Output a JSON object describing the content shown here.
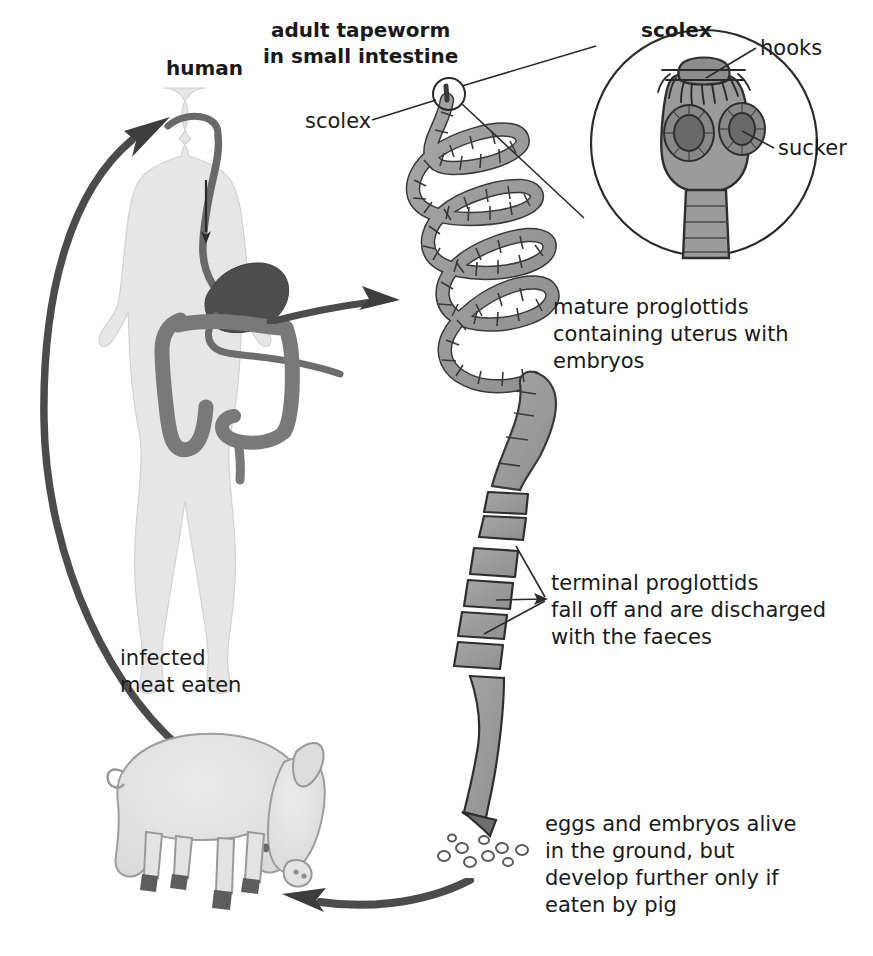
{
  "diagram": {
    "type": "biological-life-cycle-diagram",
    "palette": {
      "background": "#ffffff",
      "body_silhouette": "#e9e9e9",
      "body_outline": "#cfcfcf",
      "organ_dark": "#5a5a5a",
      "organ_mid": "#7b7b7b",
      "worm_fill": "#9d9d9d",
      "worm_outline": "#3a3a3a",
      "arrow_dark": "#4a4a4a",
      "pig_fill": "#e6e6e6",
      "pig_outline": "#9b9b9b",
      "hoof_dark": "#5e5e5e",
      "leader_line": "#3a3a3a",
      "text": "#1a1a1a"
    },
    "labels": {
      "human": "human",
      "adult_tapeworm": "adult tapeworm\nin small intestine",
      "scolex_small": "scolex",
      "scolex_magnified": "scolex",
      "hooks": "hooks",
      "sucker": "sucker",
      "mature_proglottids": "mature proglottids\ncontaining uterus with\nembryos",
      "terminal_proglottids": "terminal proglottids\nfall off and are discharged\nwith the faeces",
      "eggs": "eggs and embryos alive\nin the ground, but\ndevelop further only if\neaten by pig",
      "infected_meat": "infected\nmeat eaten"
    },
    "stages": [
      {
        "id": "human-host",
        "label": "human",
        "note": "human silhouette showing digestive tract"
      },
      {
        "id": "adult-worm",
        "label": "adult tapeworm in small intestine",
        "note": "coiled segmented worm"
      },
      {
        "id": "scolex-detail",
        "label": "scolex",
        "note": "magnified head with hooks and suckers"
      },
      {
        "id": "proglottids-mature",
        "label": "mature proglottids containing uterus with embryos"
      },
      {
        "id": "proglottids-terminal",
        "label": "terminal proglottids fall off and are discharged with the faeces"
      },
      {
        "id": "eggs-ground",
        "label": "eggs and embryos alive in the ground, but develop further only if eaten by pig"
      },
      {
        "id": "pig-host",
        "label": "pig"
      },
      {
        "id": "infection-route",
        "label": "infected meat eaten"
      }
    ]
  }
}
